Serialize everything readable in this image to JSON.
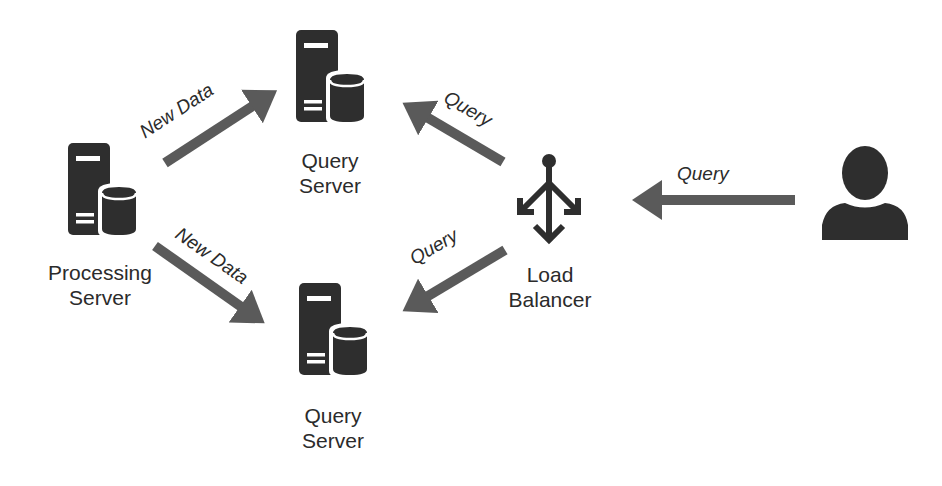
{
  "diagram": {
    "type": "architecture",
    "nodes": [
      {
        "id": "processing",
        "label_line1": "Processing",
        "label_line2": "Server",
        "icon": "server-database-icon"
      },
      {
        "id": "query_top",
        "label_line1": "Query",
        "label_line2": "Server",
        "icon": "server-database-icon"
      },
      {
        "id": "query_bottom",
        "label_line1": "Query",
        "label_line2": "Server",
        "icon": "server-database-icon"
      },
      {
        "id": "load_balancer",
        "label_line1": "Load",
        "label_line2": "Balancer",
        "icon": "load-balancer-icon"
      },
      {
        "id": "user",
        "label_line1": "",
        "label_line2": "",
        "icon": "user-icon"
      }
    ],
    "edges": [
      {
        "from": "processing",
        "to": "query_top",
        "label": "New Data"
      },
      {
        "from": "processing",
        "to": "query_bottom",
        "label": "New Data"
      },
      {
        "from": "load_balancer",
        "to": "query_top",
        "label": "Query"
      },
      {
        "from": "load_balancer",
        "to": "query_bottom",
        "label": "Query"
      },
      {
        "from": "user",
        "to": "load_balancer",
        "label": "Query"
      }
    ],
    "colors": {
      "icon": "#2e2e2e",
      "arrow": "#5a5a5a",
      "text": "#2b2b2b",
      "background": "#ffffff"
    }
  }
}
